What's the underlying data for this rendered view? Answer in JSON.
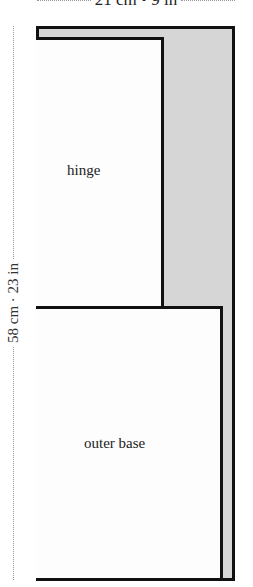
{
  "dimensions": {
    "width_label": "21 cm • 9 in",
    "height_label": "58 cm · 23 in"
  },
  "pieces": {
    "hinge": {
      "label": "hinge"
    },
    "outer_base": {
      "label": "outer base"
    }
  },
  "colors": {
    "outline": "#111111",
    "fill_background": "#d6d6d6",
    "piece_fill": "#fdfdfd",
    "dimension_dots": "#999999"
  }
}
